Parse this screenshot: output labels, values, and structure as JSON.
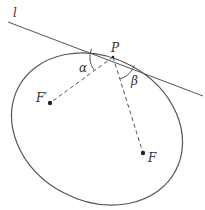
{
  "diagram": {
    "labels": {
      "tangent_line": "l",
      "point": "P",
      "focus_left": "F′",
      "focus_right": "F",
      "angle_alpha": "α",
      "angle_beta": "β"
    },
    "colors": {
      "stroke": "#555555",
      "text": "#333333",
      "background": "#ffffff"
    },
    "geometry": {
      "ellipse_center": [
        97,
        129
      ],
      "ellipse_rx": 89,
      "ellipse_ry": 72,
      "ellipse_rotation_deg": 28,
      "point_P": [
        113,
        57
      ],
      "focus_F_prime": [
        50,
        103
      ],
      "focus_F": [
        143,
        153
      ],
      "tangent_start": [
        8,
        22
      ],
      "tangent_end": [
        203,
        96
      ]
    }
  }
}
